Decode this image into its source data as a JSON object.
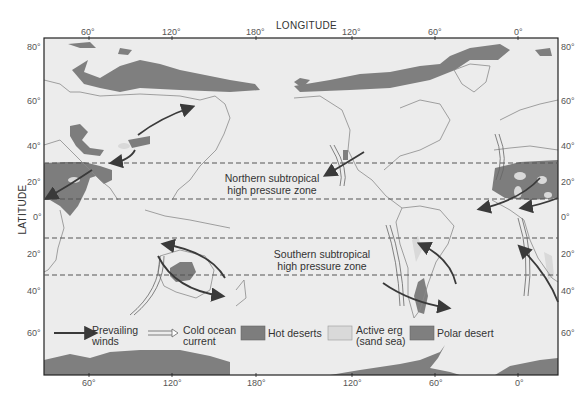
{
  "axes": {
    "x_title": "LONGITUDE",
    "y_title": "LATITUDE",
    "top_ticks": [
      {
        "label": "60°",
        "x": 89
      },
      {
        "label": "120°",
        "x": 172
      },
      {
        "label": "180°",
        "x": 256
      },
      {
        "label": "120°",
        "x": 352
      },
      {
        "label": "60°",
        "x": 435
      },
      {
        "label": "0°",
        "x": 518
      }
    ],
    "bottom_ticks": [
      {
        "label": "60°",
        "x": 89
      },
      {
        "label": "120°",
        "x": 172
      },
      {
        "label": "180°",
        "x": 256
      },
      {
        "label": "120°",
        "x": 352
      },
      {
        "label": "60°",
        "x": 435
      },
      {
        "label": "0°",
        "x": 518
      }
    ],
    "left_ticks": [
      {
        "label": "80°",
        "y": 47
      },
      {
        "label": "60°",
        "y": 101
      },
      {
        "label": "40°",
        "y": 146
      },
      {
        "label": "20°",
        "y": 182
      },
      {
        "label": "0°",
        "y": 217
      },
      {
        "label": "20°",
        "y": 254
      },
      {
        "label": "40°",
        "y": 291
      },
      {
        "label": "60°",
        "y": 333
      }
    ],
    "right_ticks": [
      {
        "label": "80°",
        "y": 47
      },
      {
        "label": "60°",
        "y": 101
      },
      {
        "label": "40°",
        "y": 146
      },
      {
        "label": "20°",
        "y": 182
      },
      {
        "label": "0°",
        "y": 217
      },
      {
        "label": "20°",
        "y": 254
      },
      {
        "label": "40°",
        "y": 291
      },
      {
        "label": "60°",
        "y": 333
      }
    ]
  },
  "zones": {
    "north": {
      "line1": "Northern subtropical",
      "line2": "high pressure zone"
    },
    "south": {
      "line1": "Southern subtropical",
      "line2": "high pressure zone"
    }
  },
  "legend": {
    "winds": {
      "line1": "Prevailing",
      "line2": "winds"
    },
    "current": {
      "line1": "Cold ocean",
      "line2": "current"
    },
    "hot": "Hot deserts",
    "erg": {
      "line1": "Active erg",
      "line2": "(sand sea)"
    },
    "polar": "Polar desert"
  },
  "colors": {
    "ocean": "#ececec",
    "land_outline": "#8a8a8a",
    "hot_desert": "#7d7d7d",
    "active_erg": "#d9d9d9",
    "polar_desert": "#7f7f7f",
    "arrow": "#3a3a3a",
    "frame": "#222222"
  }
}
